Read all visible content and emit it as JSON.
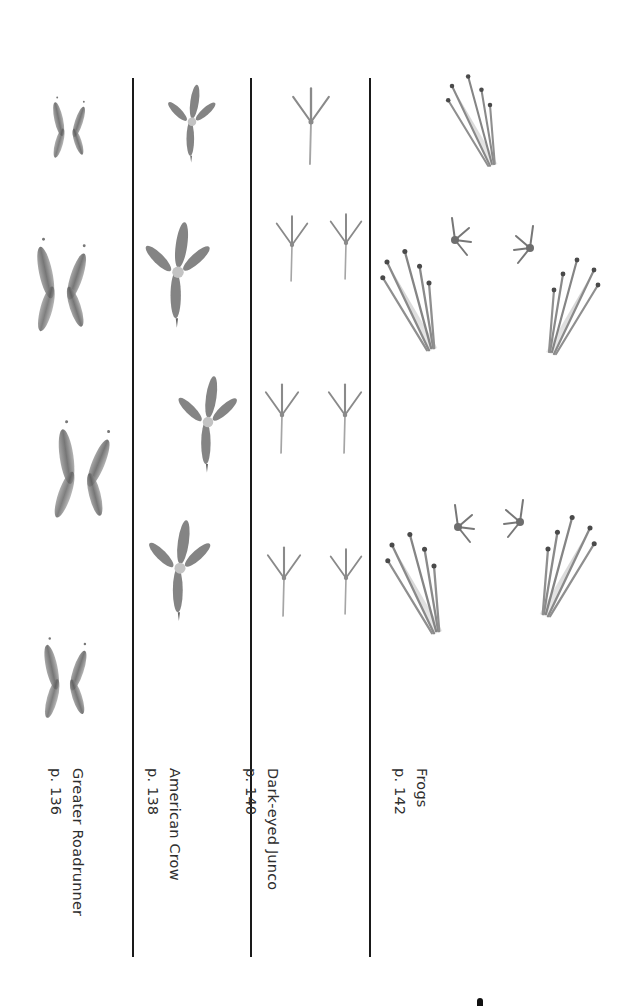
{
  "page": {
    "type": "track-comparison-plate",
    "columns": [
      {
        "id": "greater-roadrunner",
        "name": "Greater Roadrunner",
        "page_ref": "p. 136",
        "track_shape": "x-shaped zygodactyl",
        "track_count": 4
      },
      {
        "id": "american-crow",
        "name": "American Crow",
        "page_ref": "p. 138",
        "track_shape": "anisodactyl, thick toes",
        "track_count": 4
      },
      {
        "id": "dark-eyed-junco",
        "name": "Dark-eyed Junco",
        "page_ref": "p. 140",
        "track_shape": "small thin anisodactyl",
        "track_count": 7
      },
      {
        "id": "frogs",
        "name": "Frogs",
        "page_ref": "p. 142",
        "track_shape": "long hind feet with small front feet",
        "track_count": 9
      }
    ],
    "colors": {
      "background": "#ffffff",
      "divider": "#1a1a1a",
      "track_fill": "#7a7a7a",
      "track_dark": "#4a4a4a",
      "text": "#2e2e2e"
    }
  }
}
